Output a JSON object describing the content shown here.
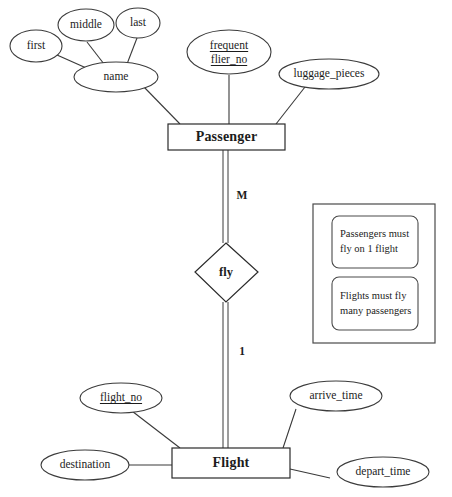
{
  "diagram": {
    "type": "entity-relationship-diagram"
  },
  "entities": [
    {
      "id": "passenger",
      "label": "Passenger"
    },
    {
      "id": "flight",
      "label": "Flight"
    }
  ],
  "relationship": {
    "id": "fly",
    "label": "fly"
  },
  "cardinalities": {
    "passenger_side": "M",
    "flight_side": "1"
  },
  "attributes": {
    "passenger": [
      {
        "id": "first",
        "label": "first",
        "key": false
      },
      {
        "id": "middle",
        "label": "middle",
        "key": false
      },
      {
        "id": "last",
        "label": "last",
        "key": false
      },
      {
        "id": "name",
        "label": "name",
        "key": false,
        "composite": true
      },
      {
        "id": "frequent_flier_no",
        "label_line1": "frequent",
        "label_line2": "flier_no",
        "key": true
      },
      {
        "id": "luggage_pieces",
        "label": "luggage_pieces",
        "key": false
      }
    ],
    "flight": [
      {
        "id": "flight_no",
        "label": "flight_no",
        "key": true
      },
      {
        "id": "destination",
        "label": "destination",
        "key": false
      },
      {
        "id": "arrive_time",
        "label": "arrive_time",
        "key": false
      },
      {
        "id": "depart_time",
        "label": "depart_time",
        "key": false
      }
    ]
  },
  "notes": {
    "items": [
      {
        "id": "note-1",
        "line1": "Passengers must",
        "line2": "fly on 1 flight"
      },
      {
        "id": "note-2",
        "line1": "Flights must fly",
        "line2": "many passengers"
      }
    ]
  },
  "colors": {
    "background": "#ffffff",
    "stroke": "#3b3b3b",
    "text": "#1c1c1c"
  }
}
